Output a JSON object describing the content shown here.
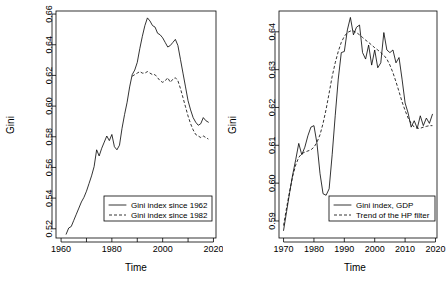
{
  "figure": {
    "background_color": "#ffffff",
    "line_color": "#000000",
    "panel_count": 2
  },
  "chart_data": [
    {
      "type": "line",
      "panel": "left",
      "title": "",
      "xlabel": "Time",
      "ylabel": "Gini",
      "xlim": [
        1958,
        2021
      ],
      "ylim": [
        0.514,
        0.662
      ],
      "grid": false,
      "legend_position": "bottom-right",
      "xticks_labeled": [
        "1960",
        "1980",
        "2000",
        "2020"
      ],
      "xtick_values": [
        1960,
        1980,
        2000,
        2020
      ],
      "xtick_minor": [
        1970,
        1990,
        2010
      ],
      "yticks_labeled": [
        "0.52",
        "0.54",
        "0.56",
        "0.58",
        "0.60",
        "0.62",
        "0.64",
        "0.66"
      ],
      "ytick_values": [
        0.52,
        0.54,
        0.56,
        0.58,
        0.6,
        0.62,
        0.64,
        0.66
      ],
      "series": [
        {
          "name": "Gini index since 1962",
          "style": "solid",
          "x": [
            1962,
            1963,
            1964,
            1965,
            1966,
            1967,
            1968,
            1969,
            1970,
            1971,
            1972,
            1973,
            1974,
            1975,
            1976,
            1977,
            1978,
            1979,
            1980,
            1981,
            1982,
            1983,
            1984,
            1985,
            1986,
            1987,
            1988,
            1989,
            1990,
            1991,
            1992,
            1993,
            1994,
            1995,
            1996,
            1997,
            1998,
            1999,
            2000,
            2001,
            2002,
            2003,
            2004,
            2005,
            2006,
            2007,
            2008,
            2009,
            2010,
            2011,
            2012,
            2013,
            2014,
            2015,
            2016,
            2017,
            2018
          ],
          "y": [
            0.5165,
            0.5205,
            0.5215,
            0.5255,
            0.5295,
            0.5335,
            0.5375,
            0.5405,
            0.5445,
            0.5495,
            0.5545,
            0.5605,
            0.5715,
            0.5675,
            0.5725,
            0.5765,
            0.5805,
            0.5775,
            0.5815,
            0.5735,
            0.5715,
            0.5745,
            0.5855,
            0.5945,
            0.6025,
            0.6125,
            0.6205,
            0.6235,
            0.6285,
            0.6375,
            0.6455,
            0.6525,
            0.6575,
            0.6555,
            0.6525,
            0.6515,
            0.6475,
            0.6465,
            0.6445,
            0.6415,
            0.6385,
            0.6395,
            0.6415,
            0.6435,
            0.6395,
            0.6305,
            0.6215,
            0.6125,
            0.6035,
            0.5975,
            0.5925,
            0.5895,
            0.5875,
            0.5885,
            0.5925,
            0.5905,
            0.5895
          ]
        },
        {
          "name": "Gini index since 1982",
          "style": "dashed",
          "x": [
            1988,
            1989,
            1990,
            1991,
            1992,
            1993,
            1994,
            1995,
            1996,
            1997,
            1998,
            1999,
            2000,
            2001,
            2002,
            2003,
            2004,
            2005,
            2006,
            2007,
            2008,
            2009,
            2010,
            2011,
            2012,
            2013,
            2014,
            2015,
            2016,
            2017,
            2018
          ],
          "y": [
            0.6195,
            0.6205,
            0.6215,
            0.6225,
            0.6215,
            0.6215,
            0.6225,
            0.6215,
            0.6205,
            0.6205,
            0.6185,
            0.6165,
            0.6155,
            0.6165,
            0.6185,
            0.6155,
            0.6175,
            0.6185,
            0.6165,
            0.6115,
            0.6055,
            0.5995,
            0.5935,
            0.5885,
            0.5845,
            0.5815,
            0.5805,
            0.5795,
            0.5805,
            0.5795,
            0.5785
          ]
        }
      ]
    },
    {
      "type": "line",
      "panel": "right",
      "title": "",
      "xlabel": "Time",
      "ylabel": "Gini",
      "xlim": [
        1968.5,
        2020.5
      ],
      "ylim": [
        0.5855,
        0.6455
      ],
      "grid": false,
      "legend_position": "bottom-right",
      "xticks_labeled": [
        "1970",
        "1980",
        "1990",
        "2000",
        "2010",
        "2020"
      ],
      "xtick_values": [
        1970,
        1980,
        1990,
        2000,
        2010,
        2020
      ],
      "yticks_labeled": [
        "0.59",
        "0.60",
        "0.61",
        "0.62",
        "0.63",
        "0.64"
      ],
      "ytick_values": [
        0.59,
        0.6,
        0.61,
        0.62,
        0.63,
        0.64
      ],
      "series": [
        {
          "name": "Gini index, GDP",
          "style": "solid",
          "x": [
            1970,
            1971,
            1972,
            1973,
            1974,
            1975,
            1976,
            1977,
            1978,
            1979,
            1980,
            1981,
            1982,
            1983,
            1984,
            1985,
            1986,
            1987,
            1988,
            1989,
            1990,
            1991,
            1992,
            1993,
            1994,
            1995,
            1996,
            1997,
            1998,
            1999,
            2000,
            2001,
            2002,
            2003,
            2004,
            2005,
            2006,
            2007,
            2008,
            2009,
            2010,
            2011,
            2012,
            2013,
            2014,
            2015,
            2016,
            2017,
            2018,
            2019
          ],
          "y": [
            0.5875,
            0.5925,
            0.5975,
            0.6022,
            0.6062,
            0.6105,
            0.6075,
            0.6095,
            0.6125,
            0.6148,
            0.6152,
            0.6105,
            0.6025,
            0.5972,
            0.5968,
            0.5985,
            0.6075,
            0.6178,
            0.6275,
            0.6345,
            0.6348,
            0.6405,
            0.6438,
            0.6392,
            0.6412,
            0.6418,
            0.6345,
            0.6328,
            0.6365,
            0.6312,
            0.6352,
            0.6305,
            0.6318,
            0.6398,
            0.6352,
            0.6345,
            0.6352,
            0.6318,
            0.6332,
            0.6275,
            0.6212,
            0.6185,
            0.6148,
            0.6165,
            0.6145,
            0.6178,
            0.6152,
            0.6172,
            0.6158,
            0.6182
          ]
        },
        {
          "name": "Trend of the HP filter",
          "style": "dashed",
          "x": [
            1970,
            1971,
            1972,
            1973,
            1974,
            1975,
            1976,
            1977,
            1978,
            1979,
            1980,
            1981,
            1982,
            1983,
            1984,
            1985,
            1986,
            1987,
            1988,
            1989,
            1990,
            1991,
            1992,
            1993,
            1994,
            1995,
            1996,
            1997,
            1998,
            1999,
            2000,
            2001,
            2002,
            2003,
            2004,
            2005,
            2006,
            2007,
            2008,
            2009,
            2010,
            2011,
            2012,
            2013,
            2014,
            2015,
            2016,
            2017,
            2018,
            2019
          ],
          "y": [
            0.5888,
            0.5935,
            0.5978,
            0.6018,
            0.6048,
            0.6068,
            0.6078,
            0.6082,
            0.6085,
            0.6088,
            0.6095,
            0.6108,
            0.6128,
            0.6158,
            0.6195,
            0.6238,
            0.6282,
            0.6318,
            0.6348,
            0.6372,
            0.6388,
            0.6398,
            0.6402,
            0.6402,
            0.6398,
            0.6392,
            0.6385,
            0.6378,
            0.6372,
            0.6365,
            0.6358,
            0.6352,
            0.6345,
            0.6338,
            0.6328,
            0.6312,
            0.6292,
            0.6268,
            0.6242,
            0.6215,
            0.6192,
            0.6172,
            0.6158,
            0.6148,
            0.6145,
            0.6145,
            0.6148,
            0.615,
            0.6152,
            0.6152
          ]
        }
      ]
    }
  ]
}
